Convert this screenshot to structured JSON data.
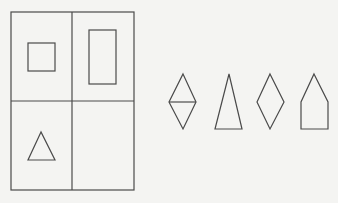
{
  "puzzle": {
    "grid": {
      "rows": 2,
      "cols": 2,
      "cells": [
        {
          "position": "top-left",
          "shape": "square"
        },
        {
          "position": "top-right",
          "shape": "tall-rectangle"
        },
        {
          "position": "bottom-left",
          "shape": "triangle"
        },
        {
          "position": "bottom-right",
          "shape": "empty"
        }
      ]
    },
    "options": [
      {
        "shape": "diamond-with-horizontal-line"
      },
      {
        "shape": "tall-triangle"
      },
      {
        "shape": "diamond"
      },
      {
        "shape": "pentagon"
      }
    ],
    "colors": {
      "line": "#4a4a4a",
      "background": "#f4f4f2"
    }
  }
}
